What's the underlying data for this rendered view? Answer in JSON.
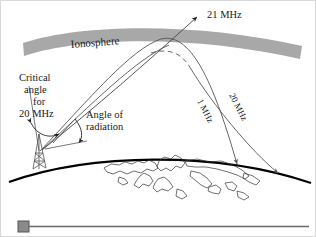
{
  "figure": {
    "width": 316,
    "height": 237,
    "background_color": "#ffffff",
    "border_color": "#d8d8d8"
  },
  "ionosphere": {
    "label": "Ionosphere",
    "fill_color": "#a8a8a8",
    "label_rotation_deg": -5
  },
  "earth": {
    "label": "earth-surface-arc",
    "stroke_color": "#000000",
    "coastline_color": "#333333"
  },
  "transmitter": {
    "label": "antenna-tower",
    "stroke_color": "#555555"
  },
  "annotations": {
    "critical_angle": {
      "line1": "Critical",
      "line2": "angle",
      "line3": "for",
      "line4": "20 MHz"
    },
    "angle_of_radiation": {
      "line1": "Angle of",
      "line2": "radiation"
    }
  },
  "rays": [
    {
      "id": "ray-21mhz",
      "label": "21 MHz",
      "style": "solid",
      "description": "penetrates ionosphere and escapes into space",
      "label_rotation_deg": 0,
      "stroke_color": "#444444"
    },
    {
      "id": "ray-20mhz",
      "label": "20 MHz",
      "style": "dashed-then-solid",
      "description": "refracted at critical angle, returns to earth far away",
      "label_rotation_deg": 62,
      "stroke_color": "#555555"
    },
    {
      "id": "ray-1mhz",
      "label": "1 MHz",
      "style": "solid-curved",
      "description": "refracted low in ionosphere, returns to earth nearer",
      "label_rotation_deg": 62,
      "stroke_color": "#555555"
    }
  ],
  "footer": {
    "marker_label": "scale-marker-square",
    "marker_fill": "#8a8a8a",
    "rule_label": "scale-rule-line",
    "rule_color": "#6a6a6a"
  }
}
